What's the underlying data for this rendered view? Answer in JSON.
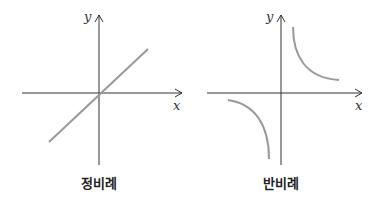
{
  "diagrams": [
    {
      "name": "direct-proportion",
      "caption": "정비례",
      "x_axis_label": "x",
      "y_axis_label": "y"
    },
    {
      "name": "inverse-proportion",
      "caption": "반비례",
      "x_axis_label": "x",
      "y_axis_label": "y"
    }
  ],
  "colors": {
    "axis": "#333333",
    "curve": "#999999"
  }
}
